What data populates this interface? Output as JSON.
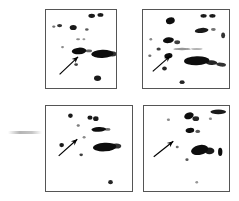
{
  "figure": {
    "type": "2d-gel-autoradiograph-panel-grid",
    "background_color": "#ffffff",
    "spot_color": "#111111",
    "border_color": "#555555",
    "arrow_color": "#000000",
    "width": 239,
    "height": 201,
    "rows": 2,
    "columns": 2
  },
  "edge_mark": {
    "name": "faint-horizontal-smudge",
    "x": 8,
    "y": 131,
    "width": 34,
    "height": 3
  },
  "panels": [
    {
      "id": "panel-top-left",
      "position": "top-left",
      "x": 45,
      "y": 9,
      "width": 72,
      "height": 80,
      "arrow": {
        "x1": 14,
        "y1": 66,
        "x2": 33,
        "y2": 48,
        "head": 7
      },
      "spots": [
        {
          "cx": 47,
          "cy": 6,
          "rx": 3.4,
          "ry": 2.2,
          "rot": 0,
          "op": 0.95
        },
        {
          "cx": 56,
          "cy": 5,
          "rx": 3.0,
          "ry": 2.0,
          "rot": 0,
          "op": 0.95
        },
        {
          "cx": 14,
          "cy": 16,
          "rx": 2.6,
          "ry": 1.7,
          "rot": 0,
          "op": 0.85
        },
        {
          "cx": 8,
          "cy": 17,
          "rx": 1.6,
          "ry": 1.2,
          "rot": 0,
          "op": 0.6
        },
        {
          "cx": 28,
          "cy": 18,
          "rx": 3.6,
          "ry": 2.6,
          "rot": 0,
          "op": 0.95
        },
        {
          "cx": 42,
          "cy": 20,
          "rx": 1.8,
          "ry": 1.4,
          "rot": 0,
          "op": 0.7
        },
        {
          "cx": 33,
          "cy": 30,
          "rx": 2.0,
          "ry": 1.1,
          "rot": 0,
          "op": 0.5
        },
        {
          "cx": 39,
          "cy": 30,
          "rx": 1.5,
          "ry": 1.0,
          "rot": 0,
          "op": 0.45
        },
        {
          "cx": 17,
          "cy": 38,
          "rx": 1.4,
          "ry": 1.2,
          "rot": 0,
          "op": 0.5
        },
        {
          "cx": 34,
          "cy": 42,
          "rx": 7.5,
          "ry": 3.4,
          "rot": -4,
          "op": 1.0
        },
        {
          "cx": 44,
          "cy": 42,
          "rx": 3.4,
          "ry": 1.4,
          "rot": 0,
          "op": 0.65
        },
        {
          "cx": 58,
          "cy": 45,
          "rx": 11.5,
          "ry": 4.2,
          "rot": -2,
          "op": 1.0
        },
        {
          "cx": 68,
          "cy": 45,
          "rx": 4.5,
          "ry": 2.6,
          "rot": 0,
          "op": 0.85
        },
        {
          "cx": 31,
          "cy": 56,
          "rx": 1.9,
          "ry": 1.5,
          "rot": 0,
          "op": 0.8
        },
        {
          "cx": 53,
          "cy": 70,
          "rx": 3.6,
          "ry": 2.8,
          "rot": 0,
          "op": 0.95
        }
      ]
    },
    {
      "id": "panel-top-right",
      "position": "top-right",
      "x": 142,
      "y": 9,
      "width": 88,
      "height": 80,
      "arrow": {
        "x1": 10,
        "y1": 63,
        "x2": 28,
        "y2": 47,
        "head": 7
      },
      "spots": [
        {
          "cx": 62,
          "cy": 6,
          "rx": 3.2,
          "ry": 2.0,
          "rot": 0,
          "op": 0.95
        },
        {
          "cx": 71,
          "cy": 6,
          "rx": 3.2,
          "ry": 2.0,
          "rot": 0,
          "op": 0.95
        },
        {
          "cx": 28,
          "cy": 11,
          "rx": 4.6,
          "ry": 3.4,
          "rot": -15,
          "op": 1.0
        },
        {
          "cx": 60,
          "cy": 21,
          "rx": 7.0,
          "ry": 2.6,
          "rot": -6,
          "op": 0.95
        },
        {
          "cx": 72,
          "cy": 20,
          "rx": 2.4,
          "ry": 1.5,
          "rot": 0,
          "op": 0.6
        },
        {
          "cx": 82,
          "cy": 26,
          "rx": 2.0,
          "ry": 3.0,
          "rot": 0,
          "op": 0.85
        },
        {
          "cx": 8,
          "cy": 30,
          "rx": 1.4,
          "ry": 1.2,
          "rot": 0,
          "op": 0.5
        },
        {
          "cx": 26,
          "cy": 31,
          "rx": 5.6,
          "ry": 3.0,
          "rot": -8,
          "op": 1.0
        },
        {
          "cx": 35,
          "cy": 33,
          "rx": 3.0,
          "ry": 2.0,
          "rot": 0,
          "op": 0.8
        },
        {
          "cx": 16,
          "cy": 40,
          "rx": 2.2,
          "ry": 1.6,
          "rot": 0,
          "op": 0.8
        },
        {
          "cx": 40,
          "cy": 40,
          "rx": 9.0,
          "ry": 1.2,
          "rot": 0,
          "op": 0.45
        },
        {
          "cx": 55,
          "cy": 40,
          "rx": 6.0,
          "ry": 1.0,
          "rot": 0,
          "op": 0.3
        },
        {
          "cx": 7,
          "cy": 47,
          "rx": 1.6,
          "ry": 1.3,
          "rot": 0,
          "op": 0.6
        },
        {
          "cx": 26,
          "cy": 47,
          "rx": 4.2,
          "ry": 2.8,
          "rot": -10,
          "op": 1.0
        },
        {
          "cx": 55,
          "cy": 52,
          "rx": 13.0,
          "ry": 4.6,
          "rot": -2,
          "op": 1.0
        },
        {
          "cx": 70,
          "cy": 54,
          "rx": 6.0,
          "ry": 2.4,
          "rot": 4,
          "op": 0.9
        },
        {
          "cx": 80,
          "cy": 56,
          "rx": 5.0,
          "ry": 2.0,
          "rot": 6,
          "op": 0.85
        },
        {
          "cx": 22,
          "cy": 60,
          "rx": 2.4,
          "ry": 2.0,
          "rot": 0,
          "op": 0.9
        },
        {
          "cx": 40,
          "cy": 74,
          "rx": 2.6,
          "ry": 2.0,
          "rot": 0,
          "op": 0.9
        }
      ]
    },
    {
      "id": "panel-bottom-left",
      "position": "bottom-left",
      "x": 45,
      "y": 105,
      "width": 88,
      "height": 87,
      "arrow": {
        "x1": 13,
        "y1": 51,
        "x2": 32,
        "y2": 34,
        "head": 7
      },
      "spots": [
        {
          "cx": 25,
          "cy": 10,
          "rx": 2.4,
          "ry": 2.2,
          "rot": 0,
          "op": 0.95
        },
        {
          "cx": 45,
          "cy": 12,
          "rx": 2.6,
          "ry": 2.2,
          "rot": 0,
          "op": 0.95
        },
        {
          "cx": 51,
          "cy": 13,
          "rx": 2.8,
          "ry": 2.4,
          "rot": 0,
          "op": 0.95
        },
        {
          "cx": 33,
          "cy": 20,
          "rx": 1.6,
          "ry": 1.3,
          "rot": 0,
          "op": 0.55
        },
        {
          "cx": 54,
          "cy": 24,
          "rx": 7.5,
          "ry": 2.4,
          "rot": -3,
          "op": 1.0
        },
        {
          "cx": 63,
          "cy": 24,
          "rx": 3.0,
          "ry": 1.4,
          "rot": 0,
          "op": 0.6
        },
        {
          "cx": 39,
          "cy": 32,
          "rx": 1.5,
          "ry": 1.2,
          "rot": 0,
          "op": 0.5
        },
        {
          "cx": 16,
          "cy": 40,
          "rx": 2.4,
          "ry": 2.2,
          "rot": 0,
          "op": 0.95
        },
        {
          "cx": 60,
          "cy": 42,
          "rx": 12.0,
          "ry": 4.4,
          "rot": -3,
          "op": 1.0
        },
        {
          "cx": 72,
          "cy": 41,
          "rx": 5.0,
          "ry": 2.6,
          "rot": 0,
          "op": 0.85
        },
        {
          "cx": 36,
          "cy": 50,
          "rx": 1.8,
          "ry": 1.5,
          "rot": 0,
          "op": 0.8
        },
        {
          "cx": 66,
          "cy": 78,
          "rx": 2.4,
          "ry": 2.2,
          "rot": 0,
          "op": 0.9
        }
      ]
    },
    {
      "id": "panel-bottom-right",
      "position": "bottom-right",
      "x": 143,
      "y": 105,
      "width": 87,
      "height": 87,
      "arrow": {
        "x1": 10,
        "y1": 52,
        "x2": 30,
        "y2": 36,
        "head": 7
      },
      "spots": [
        {
          "cx": 76,
          "cy": 6,
          "rx": 8.0,
          "ry": 2.4,
          "rot": 0,
          "op": 0.95
        },
        {
          "cx": 46,
          "cy": 10,
          "rx": 5.0,
          "ry": 3.4,
          "rot": -20,
          "op": 1.0
        },
        {
          "cx": 53,
          "cy": 13,
          "rx": 3.4,
          "ry": 2.4,
          "rot": 0,
          "op": 0.9
        },
        {
          "cx": 25,
          "cy": 14,
          "rx": 1.6,
          "ry": 1.3,
          "rot": 0,
          "op": 0.5
        },
        {
          "cx": 68,
          "cy": 13,
          "rx": 1.6,
          "ry": 1.3,
          "rot": 0,
          "op": 0.5
        },
        {
          "cx": 47,
          "cy": 25,
          "rx": 4.4,
          "ry": 2.6,
          "rot": -6,
          "op": 1.0
        },
        {
          "cx": 55,
          "cy": 26,
          "rx": 2.4,
          "ry": 1.6,
          "rot": 0,
          "op": 0.7
        },
        {
          "cx": 34,
          "cy": 42,
          "rx": 1.5,
          "ry": 1.3,
          "rot": 0,
          "op": 0.6
        },
        {
          "cx": 57,
          "cy": 45,
          "rx": 9.0,
          "ry": 5.0,
          "rot": -12,
          "op": 1.0
        },
        {
          "cx": 67,
          "cy": 46,
          "rx": 5.0,
          "ry": 3.4,
          "rot": 0,
          "op": 0.95
        },
        {
          "cx": 78,
          "cy": 47,
          "rx": 2.2,
          "ry": 4.2,
          "rot": 0,
          "op": 1.0
        },
        {
          "cx": 44,
          "cy": 55,
          "rx": 1.6,
          "ry": 1.4,
          "rot": 0,
          "op": 0.7
        },
        {
          "cx": 54,
          "cy": 78,
          "rx": 1.4,
          "ry": 1.2,
          "rot": 0,
          "op": 0.45
        }
      ]
    }
  ]
}
